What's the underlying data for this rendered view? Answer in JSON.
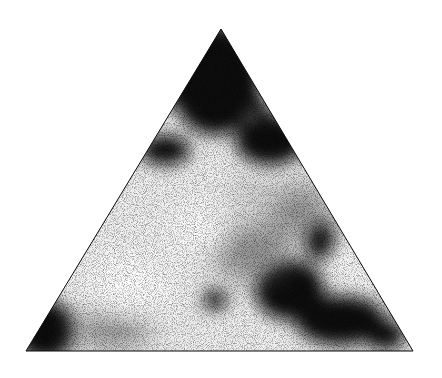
{
  "image": {
    "description": "Black-and-white mottled texture clipped to an equilateral-like triangle on a white background",
    "background_color": "#ffffff",
    "shape": "triangle",
    "vertices": {
      "apex": [
        221,
        29
      ],
      "bottom_left": [
        26,
        351
      ],
      "bottom_right": [
        413,
        351
      ]
    },
    "colors": {
      "dark": "#0a0a0a",
      "light": "#ffffff",
      "mid": "#8a8a8a"
    }
  }
}
